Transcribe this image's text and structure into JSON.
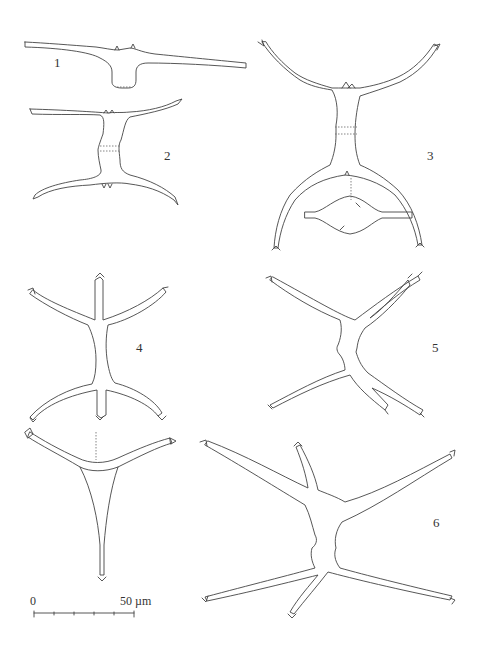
{
  "plate": {
    "figures": [
      {
        "id": 1,
        "label": "1",
        "view": "semicell, front view"
      },
      {
        "id": 2,
        "label": "2",
        "view": "cell, front view"
      },
      {
        "id": 3,
        "label": "3",
        "view": "cell, front view with apical view inset"
      },
      {
        "id": 4,
        "label": "4",
        "view": "cell, front view and apical view"
      },
      {
        "id": 5,
        "label": "5",
        "view": "cell, front view"
      },
      {
        "id": 6,
        "label": "6",
        "view": "cell, front view"
      }
    ],
    "scale_bar": {
      "start_label": "0",
      "end_label": "50 µm",
      "ticks": 6
    }
  }
}
